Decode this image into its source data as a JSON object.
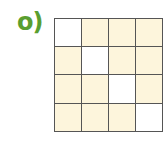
{
  "label": "o)",
  "colors": {
    "label": "#5a9e2f",
    "filled": "#fdf5dc",
    "empty": "#ffffff",
    "line": "#555555"
  },
  "grid": {
    "rows": 4,
    "cols": 4,
    "cells": [
      [
        "empty",
        "filled",
        "filled",
        "filled"
      ],
      [
        "filled",
        "empty",
        "filled",
        "filled"
      ],
      [
        "filled",
        "filled",
        "empty",
        "filled"
      ],
      [
        "filled",
        "filled",
        "filled",
        "empty"
      ]
    ]
  }
}
